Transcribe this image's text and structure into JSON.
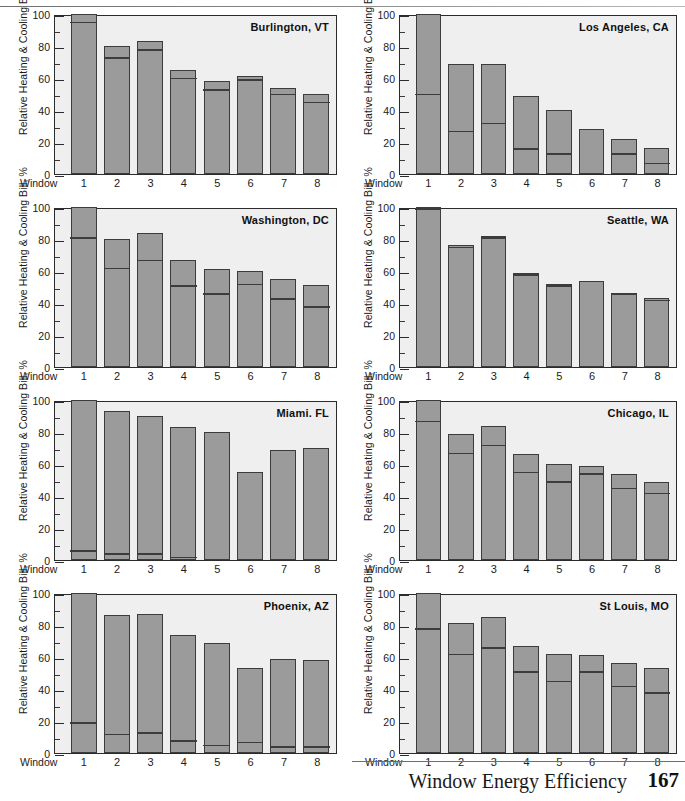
{
  "page": {
    "footer_text": "Window Energy Efficiency",
    "page_number": "167"
  },
  "axis": {
    "ylabel": "Relative Heating & Cooling Bill, %",
    "xlabel": "Window",
    "yticks": [
      "0",
      "20",
      "40",
      "60",
      "80",
      "100"
    ],
    "xticks": [
      "1",
      "2",
      "3",
      "4",
      "5",
      "6",
      "7",
      "8"
    ]
  },
  "colors": {
    "bar_fill": "#9b9b9b",
    "bar_outline": "#3c3c3c",
    "plot_background": "#efefef",
    "page_background": "#ffffff",
    "text": "#1a1a1a"
  },
  "chart_data": [
    {
      "type": "bar",
      "title": "Burlington, VT",
      "xlabel": "Window",
      "ylabel": "Relative Heating & Cooling Bill, %",
      "ylim": [
        0,
        100
      ],
      "grid": false,
      "legend": "none",
      "categories": [
        "1",
        "2",
        "3",
        "4",
        "5",
        "6",
        "7",
        "8"
      ],
      "series": [
        {
          "name": "Heating",
          "values": [
            94,
            72,
            77,
            59,
            52,
            58,
            49,
            44
          ]
        },
        {
          "name": "Cooling",
          "values": [
            6,
            8,
            6,
            6,
            6,
            3,
            5,
            6
          ]
        }
      ],
      "totals": [
        100,
        80,
        83,
        65,
        58,
        61,
        54,
        50
      ]
    },
    {
      "type": "bar",
      "title": "Los Angeles, CA",
      "xlabel": "Window",
      "ylabel": "Relative Heating & Cooling Bill, %",
      "ylim": [
        0,
        100
      ],
      "grid": false,
      "legend": "none",
      "categories": [
        "1",
        "2",
        "3",
        "4",
        "5",
        "6",
        "7",
        "8"
      ],
      "series": [
        {
          "name": "Heating",
          "values": [
            49,
            26,
            31,
            15,
            12,
            0,
            12,
            6
          ]
        },
        {
          "name": "Cooling",
          "values": [
            51,
            43,
            38,
            34,
            28,
            28,
            10,
            10
          ]
        }
      ],
      "totals": [
        100,
        69,
        69,
        49,
        40,
        28,
        22,
        16
      ]
    },
    {
      "type": "bar",
      "title": "Washington, DC",
      "xlabel": "Window",
      "ylabel": "Relative Heating & Cooling Bill, %",
      "ylim": [
        0,
        100
      ],
      "grid": false,
      "legend": "none",
      "categories": [
        "1",
        "2",
        "3",
        "4",
        "5",
        "6",
        "7",
        "8"
      ],
      "series": [
        {
          "name": "Heating",
          "values": [
            80,
            61,
            66,
            50,
            45,
            51,
            42,
            37
          ]
        },
        {
          "name": "Cooling",
          "values": [
            20,
            19,
            18,
            17,
            16,
            9,
            13,
            14
          ]
        }
      ],
      "totals": [
        100,
        80,
        84,
        67,
        61,
        60,
        55,
        51
      ]
    },
    {
      "type": "bar",
      "title": "Seattle, WA",
      "xlabel": "Window",
      "ylabel": "Relative Heating & Cooling Bill, %",
      "ylim": [
        0,
        100
      ],
      "grid": false,
      "legend": "none",
      "categories": [
        "1",
        "2",
        "3",
        "4",
        "5",
        "6",
        "7",
        "8"
      ],
      "series": [
        {
          "name": "Heating",
          "values": [
            98,
            74,
            80,
            57,
            50,
            54,
            45,
            41
          ]
        },
        {
          "name": "Cooling",
          "values": [
            2,
            2,
            2,
            2,
            2,
            0,
            1,
            2
          ]
        }
      ],
      "totals": [
        100,
        76,
        82,
        59,
        52,
        54,
        46,
        43
      ]
    },
    {
      "type": "bar",
      "title": "Miami. FL",
      "xlabel": "Window",
      "ylabel": "Relative Heating & Cooling Bill, %",
      "ylim": [
        0,
        100
      ],
      "grid": false,
      "legend": "none",
      "categories": [
        "1",
        "2",
        "3",
        "4",
        "5",
        "6",
        "7",
        "8"
      ],
      "series": [
        {
          "name": "Heating",
          "values": [
            5,
            3,
            3,
            1,
            0,
            0,
            0,
            0
          ]
        },
        {
          "name": "Cooling",
          "values": [
            95,
            90,
            87,
            82,
            80,
            55,
            69,
            70
          ]
        }
      ],
      "totals": [
        100,
        93,
        90,
        83,
        80,
        55,
        69,
        70
      ]
    },
    {
      "type": "bar",
      "title": "Chicago, IL",
      "xlabel": "Window",
      "ylabel": "Relative Heating & Cooling Bill, %",
      "ylim": [
        0,
        100
      ],
      "grid": false,
      "legend": "none",
      "categories": [
        "1",
        "2",
        "3",
        "4",
        "5",
        "6",
        "7",
        "8"
      ],
      "series": [
        {
          "name": "Heating",
          "values": [
            86,
            66,
            71,
            54,
            48,
            53,
            44,
            41
          ]
        },
        {
          "name": "Cooling",
          "values": [
            14,
            13,
            13,
            12,
            12,
            6,
            10,
            8
          ]
        }
      ],
      "totals": [
        100,
        79,
        84,
        66,
        60,
        59,
        54,
        49
      ]
    },
    {
      "type": "bar",
      "title": "Phoenix, AZ",
      "xlabel": "Window",
      "ylabel": "Relative Heating & Cooling Bill, %",
      "ylim": [
        0,
        100
      ],
      "grid": false,
      "legend": "none",
      "categories": [
        "1",
        "2",
        "3",
        "4",
        "5",
        "6",
        "7",
        "8"
      ],
      "series": [
        {
          "name": "Heating",
          "values": [
            18,
            11,
            12,
            7,
            4,
            6,
            3,
            3
          ]
        },
        {
          "name": "Cooling",
          "values": [
            82,
            75,
            75,
            67,
            65,
            47,
            56,
            55
          ]
        }
      ],
      "totals": [
        100,
        86,
        87,
        74,
        69,
        53,
        59,
        58
      ]
    },
    {
      "type": "bar",
      "title": "St Louis, MO",
      "xlabel": "Window",
      "ylabel": "Relative Heating & Cooling Bill, %",
      "ylim": [
        0,
        100
      ],
      "grid": false,
      "legend": "none",
      "categories": [
        "1",
        "2",
        "3",
        "4",
        "5",
        "6",
        "7",
        "8"
      ],
      "series": [
        {
          "name": "Heating",
          "values": [
            77,
            61,
            65,
            50,
            44,
            50,
            41,
            37
          ]
        },
        {
          "name": "Cooling",
          "values": [
            23,
            20,
            20,
            17,
            18,
            11,
            15,
            16
          ]
        }
      ],
      "totals": [
        100,
        81,
        85,
        67,
        62,
        61,
        56,
        53
      ]
    }
  ]
}
